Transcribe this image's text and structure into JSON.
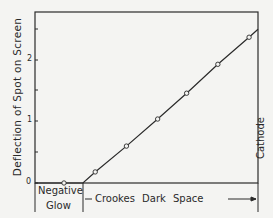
{
  "chart_data": {
    "type": "line",
    "title": "",
    "xlabel": "",
    "ylabel": "Deflection of Spot on Screen",
    "ylim": [
      0,
      2.75
    ],
    "y_ticks": [
      0,
      1,
      2
    ],
    "y_minor_ticks": [
      0.5,
      1.5,
      2.5
    ],
    "x_units": "relative position across discharge (0 = left edge of frame, 1 = cathode)",
    "grid": false,
    "legend": null,
    "series": [
      {
        "name": "Deflection",
        "x": [
          0.13,
          0.27,
          0.41,
          0.55,
          0.68,
          0.82,
          0.96
        ],
        "y": [
          0.0,
          0.18,
          0.6,
          1.04,
          1.46,
          1.93,
          2.37
        ]
      }
    ],
    "line_start_x": 0.215,
    "annotations": [
      {
        "text": "Cathode",
        "position": "right edge, vertical"
      },
      {
        "text": "Negative Glow",
        "position": "below x-axis, left region"
      },
      {
        "text": "Crookes Dark Space",
        "position": "below x-axis, from negative glow boundary to cathode"
      }
    ]
  },
  "labels": {
    "ylabel": "Deflection of Spot on Screen",
    "tick_0": "0",
    "tick_1": "1",
    "tick_2": "2",
    "cathode": "Cathode",
    "negative_line1": "Negative",
    "negative_line2": "Glow",
    "crookes": "Crookes Dark Space"
  },
  "colors": {
    "ink": "#2a2a2a",
    "paper": "#f4f4f2"
  }
}
